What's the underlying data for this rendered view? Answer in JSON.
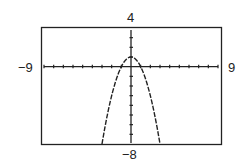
{
  "chart_data": {
    "type": "line",
    "title": "",
    "xlabel": "",
    "ylabel": "",
    "xlim": [
      -9,
      9
    ],
    "ylim": [
      -8,
      4
    ],
    "x_tick_step": 1,
    "y_tick_step": 1,
    "grid": false,
    "series": [
      {
        "name": "y = 1 - x^2",
        "style": "dashed-pixel",
        "x": [
          -3,
          -2.5,
          -2,
          -1.5,
          -1,
          -0.5,
          0,
          0.5,
          1,
          1.5,
          2,
          2.5,
          3
        ],
        "y": [
          -8,
          -5.25,
          -3,
          -1.25,
          0,
          0.75,
          1,
          0.75,
          0,
          -1.25,
          -3,
          -5.25,
          -8
        ]
      }
    ],
    "window_labels": {
      "ymax": "4",
      "ymin": "-8",
      "xmin": "-9",
      "xmax": "9"
    }
  },
  "labels": {
    "top": "4",
    "bottom": "−8",
    "left": "−9",
    "right": "9"
  }
}
